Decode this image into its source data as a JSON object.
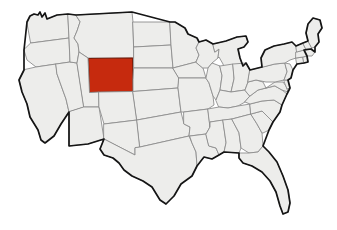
{
  "figure": {
    "kind": "choropleth-locator-map",
    "background_color": "#ffffff",
    "width": 337,
    "height": 230
  },
  "map": {
    "name": "united-states-contiguous",
    "projection_note": "contiguous 48 states, Alaska and Hawaii not shown",
    "state_fill_color": "#ededeb",
    "state_border_color": "#8d8d8d",
    "nation_outline_color": "#151515",
    "highlight_color": "#c62a0e",
    "highlight_border_color": "#7d1a06",
    "highlighted_states": [
      "Wyoming"
    ],
    "states": [
      {
        "code": "WA",
        "name": "Washington",
        "highlighted": false
      },
      {
        "code": "OR",
        "name": "Oregon",
        "highlighted": false
      },
      {
        "code": "CA",
        "name": "California",
        "highlighted": false
      },
      {
        "code": "NV",
        "name": "Nevada",
        "highlighted": false
      },
      {
        "code": "ID",
        "name": "Idaho",
        "highlighted": false
      },
      {
        "code": "MT",
        "name": "Montana",
        "highlighted": false
      },
      {
        "code": "WY",
        "name": "Wyoming",
        "highlighted": true
      },
      {
        "code": "UT",
        "name": "Utah",
        "highlighted": false
      },
      {
        "code": "AZ",
        "name": "Arizona",
        "highlighted": false
      },
      {
        "code": "CO",
        "name": "Colorado",
        "highlighted": false
      },
      {
        "code": "NM",
        "name": "New Mexico",
        "highlighted": false
      },
      {
        "code": "ND",
        "name": "North Dakota",
        "highlighted": false
      },
      {
        "code": "SD",
        "name": "South Dakota",
        "highlighted": false
      },
      {
        "code": "NE",
        "name": "Nebraska",
        "highlighted": false
      },
      {
        "code": "KS",
        "name": "Kansas",
        "highlighted": false
      },
      {
        "code": "OK",
        "name": "Oklahoma",
        "highlighted": false
      },
      {
        "code": "TX",
        "name": "Texas",
        "highlighted": false
      },
      {
        "code": "MN",
        "name": "Minnesota",
        "highlighted": false
      },
      {
        "code": "IA",
        "name": "Iowa",
        "highlighted": false
      },
      {
        "code": "MO",
        "name": "Missouri",
        "highlighted": false
      },
      {
        "code": "AR",
        "name": "Arkansas",
        "highlighted": false
      },
      {
        "code": "LA",
        "name": "Louisiana",
        "highlighted": false
      },
      {
        "code": "WI",
        "name": "Wisconsin",
        "highlighted": false
      },
      {
        "code": "IL",
        "name": "Illinois",
        "highlighted": false
      },
      {
        "code": "MI",
        "name": "Michigan",
        "highlighted": false
      },
      {
        "code": "IN",
        "name": "Indiana",
        "highlighted": false
      },
      {
        "code": "OH",
        "name": "Ohio",
        "highlighted": false
      },
      {
        "code": "KY",
        "name": "Kentucky",
        "highlighted": false
      },
      {
        "code": "TN",
        "name": "Tennessee",
        "highlighted": false
      },
      {
        "code": "MS",
        "name": "Mississippi",
        "highlighted": false
      },
      {
        "code": "AL",
        "name": "Alabama",
        "highlighted": false
      },
      {
        "code": "GA",
        "name": "Georgia",
        "highlighted": false
      },
      {
        "code": "FL",
        "name": "Florida",
        "highlighted": false
      },
      {
        "code": "SC",
        "name": "South Carolina",
        "highlighted": false
      },
      {
        "code": "NC",
        "name": "North Carolina",
        "highlighted": false
      },
      {
        "code": "VA",
        "name": "Virginia",
        "highlighted": false
      },
      {
        "code": "WV",
        "name": "West Virginia",
        "highlighted": false
      },
      {
        "code": "MD",
        "name": "Maryland",
        "highlighted": false
      },
      {
        "code": "DE",
        "name": "Delaware",
        "highlighted": false
      },
      {
        "code": "PA",
        "name": "Pennsylvania",
        "highlighted": false
      },
      {
        "code": "NJ",
        "name": "New Jersey",
        "highlighted": false
      },
      {
        "code": "NY",
        "name": "New York",
        "highlighted": false
      },
      {
        "code": "CT",
        "name": "Connecticut",
        "highlighted": false
      },
      {
        "code": "RI",
        "name": "Rhode Island",
        "highlighted": false
      },
      {
        "code": "MA",
        "name": "Massachusetts",
        "highlighted": false
      },
      {
        "code": "VT",
        "name": "Vermont",
        "highlighted": false
      },
      {
        "code": "NH",
        "name": "New Hampshire",
        "highlighted": false
      },
      {
        "code": "ME",
        "name": "Maine",
        "highlighted": false
      }
    ]
  }
}
